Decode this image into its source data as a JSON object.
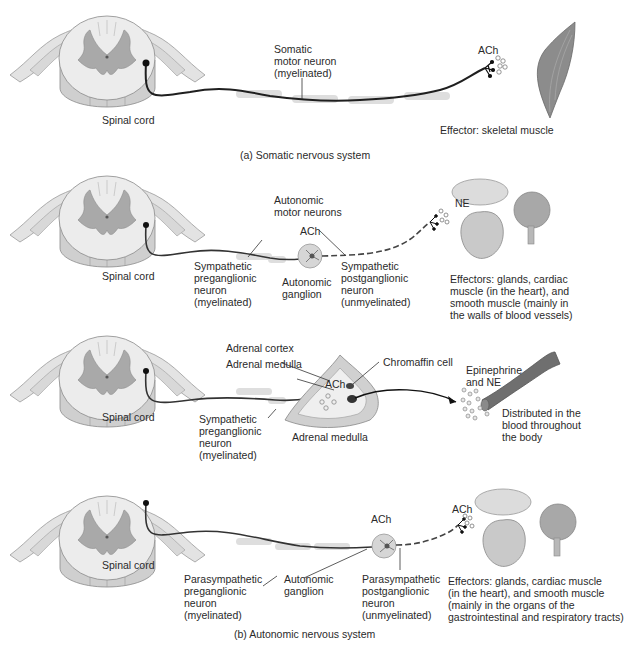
{
  "colors": {
    "cord_white_matter": "#e9e9e9",
    "cord_gray_matter": "#a9a9a9",
    "cord_outline": "#8a8a8a",
    "neuron_line": "#333333",
    "myelin": "#d9d9d9",
    "muscle": "#8c8c8c",
    "vessel": "#6f6f6f",
    "text": "#2a2a2a"
  },
  "panel_a": {
    "spinal_cord_label": "Spinal cord",
    "neuron_label": "Somatic\nmotor neuron\n(myelinated)",
    "neurotransmitter": "ACh",
    "effector_label": "Effector: skeletal muscle",
    "caption": "(a) Somatic nervous system"
  },
  "panel_b1": {
    "spinal_cord_label": "Spinal cord",
    "group_label": "Autonomic\nmotor neurons",
    "ganglion_transmitter": "ACh",
    "preganglionic_label": "Sympathetic\npreganglionic\nneuron\n(myelinated)",
    "ganglion_label": "Autonomic\nganglion",
    "postganglionic_label": "Sympathetic\npostganglionic\nneuron\n(unmyelinated)",
    "effector_transmitter": "NE",
    "effectors_label": "Effectors: glands, cardiac\nmuscle (in the heart), and\nsmooth muscle (mainly in\nthe walls of blood vessels)"
  },
  "panel_b2": {
    "spinal_cord_label": "Spinal cord",
    "adrenal_cortex_label": "Adrenal cortex",
    "adrenal_medulla_label_top": "Adrenal medulla",
    "chromaffin_label": "Chromaffin cell",
    "transmitter": "ACh",
    "preganglionic_label": "Sympathetic\npreganglionic\nneuron\n(myelinated)",
    "adrenal_medulla_label_bottom": "Adrenal medulla",
    "hormones_label": "Epinephrine\nand NE",
    "distribution_label": "Distributed in the\nblood throughout\nthe body"
  },
  "panel_b3": {
    "spinal_cord_label": "Spinal cord",
    "ganglion_transmitter": "ACh",
    "effector_transmitter": "ACh",
    "preganglionic_label": "Parasympathetic\npreganglionic\nneuron\n(myelinated)",
    "ganglion_label": "Autonomic\nganglion",
    "postganglionic_label": "Parasympathetic\npostganglionic\nneuron\n(unmyelinated)",
    "effectors_label": "Effectors: glands, cardiac muscle\n(in the heart), and smooth muscle\n(mainly in the organs of the\ngastrointestinal and respiratory tracts)",
    "caption": "(b) Autonomic nervous system"
  }
}
